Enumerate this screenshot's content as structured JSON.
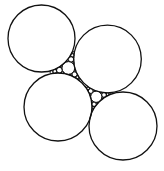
{
  "diagram": {
    "type": "apollonian-circle-packing",
    "width": 164,
    "height": 171,
    "background": "#ffffff",
    "stroke": "#111111",
    "large_circles": [
      {
        "id": "A",
        "cx": 41.5,
        "cy": 38.5,
        "r": 33.5
      },
      {
        "id": "B",
        "cx": 107.5,
        "cy": 59.0,
        "r": 33.8
      },
      {
        "id": "C",
        "cx": 58.0,
        "cy": 107.0,
        "r": 34.0
      },
      {
        "id": "D",
        "cx": 123.0,
        "cy": 126.0,
        "r": 34.0
      }
    ],
    "gaps": [
      {
        "between": [
          "A",
          "B",
          "C"
        ],
        "depth": 4
      },
      {
        "between": [
          "B",
          "C",
          "D"
        ],
        "depth": 4
      }
    ]
  }
}
